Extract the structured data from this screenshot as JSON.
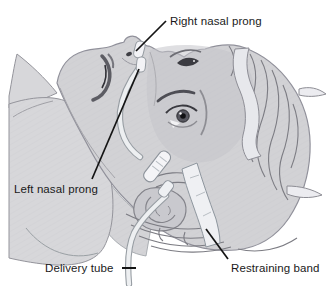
{
  "figure": {
    "labels": {
      "right_nasal_prong": "Right nasal prong",
      "left_nasal_prong": "Left nasal prong",
      "delivery_tube": "Delivery tube",
      "restraining_band": "Restraining band"
    },
    "colors": {
      "background": "#ffffff",
      "skin": "#d3d3d6",
      "skin_shadow": "#c5c5ca",
      "outline": "#90909a",
      "hair_stroke": "#7c7c83",
      "tube_fill": "#edeff1",
      "tube_edge": "#979da3",
      "band_fill": "#e7e8ec",
      "leader_line": "#141414",
      "label_text": "#1a1a1a"
    }
  }
}
